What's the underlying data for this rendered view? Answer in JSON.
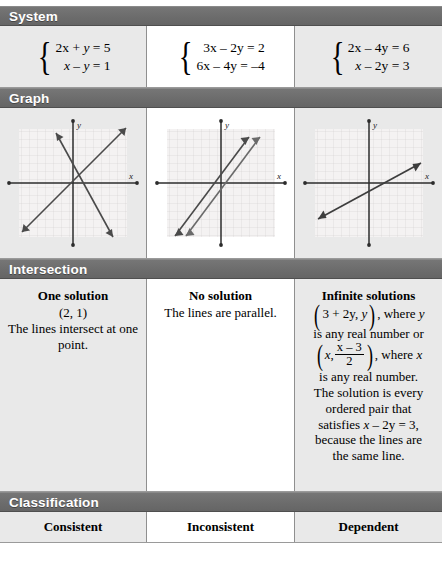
{
  "sections": {
    "system": {
      "label": "System"
    },
    "graph": {
      "label": "Graph"
    },
    "intersection": {
      "label": "Intersection"
    },
    "classification": {
      "label": "Classification"
    }
  },
  "columns": [
    {
      "system": {
        "eq1": "2x + y = 5",
        "eq2": "x – y = 1"
      },
      "graph": {
        "x_axis_label": "x",
        "y_axis_label": "y",
        "description": "Two lines crossing at one point",
        "lines": [
          {
            "slope": 1,
            "intercept": -1
          },
          {
            "slope": -2,
            "intercept": 5
          }
        ]
      },
      "intersection": {
        "title": "One solution",
        "point": "(2, 1)",
        "body": "The lines intersect at one point."
      },
      "classification": "Consistent"
    },
    {
      "system": {
        "eq1": "3x – 2y = 2",
        "eq2": "6x – 4y = –4"
      },
      "graph": {
        "x_axis_label": "x",
        "y_axis_label": "y",
        "description": "Two parallel lines",
        "lines": [
          {
            "slope": 1.5,
            "intercept": -1
          },
          {
            "slope": 1.5,
            "intercept": 1
          }
        ]
      },
      "intersection": {
        "title": "No solution",
        "point": "",
        "body": "The lines are parallel."
      },
      "classification": "Inconsistent"
    },
    {
      "system": {
        "eq1": "2x – 4y = 6",
        "eq2": "x – 2y = 3"
      },
      "graph": {
        "x_axis_label": "x",
        "y_axis_label": "y",
        "description": "Two coincident lines (one visible line)",
        "lines": [
          {
            "slope": 0.5,
            "intercept": -1.5
          }
        ]
      },
      "intersection": {
        "title": "Infinite solutions",
        "pair1_open": "(",
        "pair1": "3 + 2y, y",
        "pair1_close": ")",
        "after_pair1": ",  where y",
        "line2": "is any real number or",
        "pair2_x": "x,",
        "frac_num": "x – 3",
        "frac_den": "2",
        "after_pair2": ", where x",
        "line4": "is any real number.",
        "line5": "The solution is every",
        "line6": "ordered pair that",
        "line7_a": "satisfies ",
        "line7_b": "x – 2y = 3",
        "line7_c": ",",
        "line8": "because the lines are",
        "line9": "the same line."
      },
      "classification": "Dependent"
    }
  ],
  "colors": {
    "header_bar": "#6e6e6e",
    "header_text": "#ffffff",
    "cell_gray": "#e9e9e9",
    "cell_white": "#ffffff",
    "border": "#9a9a9a",
    "graph_grid": "#d9d4d4",
    "graph_axis": "#2c2c2c",
    "graph_line": "#4a4a4a"
  }
}
